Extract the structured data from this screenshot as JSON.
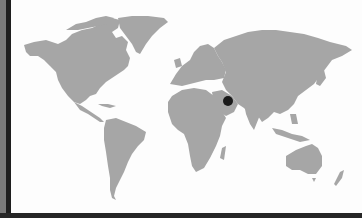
{
  "map": {
    "type": "world-map",
    "land_color": "#a6a6a6",
    "ocean_color": "#fdfdfd",
    "frame_color": "#1e1e1e",
    "markers": [
      {
        "name": "location-marker",
        "region": "Arabian Peninsula / Persian Gulf",
        "x": 228,
        "y": 101,
        "radius": 5,
        "color": "#1a1a1a"
      }
    ]
  }
}
